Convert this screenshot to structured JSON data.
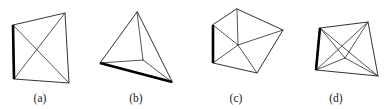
{
  "figure": {
    "background_color": "#ffffff",
    "line_color": "#1c1c1c",
    "bold_line_color": "#000000",
    "panel_count": 4
  },
  "captions": {
    "a": "(a)",
    "b": "(b)",
    "c": "(c)",
    "d": "(d)"
  },
  "caption_positions": {
    "a": {
      "x": 40,
      "y": 102
    },
    "b": {
      "x": 136,
      "y": 102
    },
    "c": {
      "x": 236,
      "y": 102
    },
    "d": {
      "x": 336,
      "y": 102
    }
  },
  "shapes": {
    "a": {
      "name": "quadrilateral-with-two-diagonals",
      "outline": "13,25 65,13 69,83 14,79",
      "bold_edge": "13,25 14,79",
      "inner_edges": [
        "13,25 69,83",
        "65,13 14,79"
      ]
    },
    "b": {
      "name": "tetrahedron-projection",
      "outline": "137,12 100,63 172,82",
      "bold_edge": "100,63 172,82",
      "inner_edges": [
        "137,12 143,60",
        "100,63 143,60",
        "172,82 143,60"
      ]
    },
    "c": {
      "name": "pentagon-with-central-fan",
      "outline": "237,9 283,30 257,73 213,63 213,25",
      "bold_edge": "213,25 213,63",
      "inner_edges": [
        "238,45 237,9",
        "238,45 283,30",
        "238,45 257,73",
        "238,45 213,63",
        "238,45 213,25"
      ]
    },
    "d": {
      "name": "quadrilateral-with-interior-vertex",
      "outline": "320,28 368,22 378,76 316,70",
      "bold_edge": "320,28 316,70",
      "inner_edges": [
        "320,28 378,76",
        "368,22 316,70",
        "368,22 345,58",
        "320,28 345,58",
        "316,70 345,58",
        "378,76 345,58"
      ]
    }
  }
}
